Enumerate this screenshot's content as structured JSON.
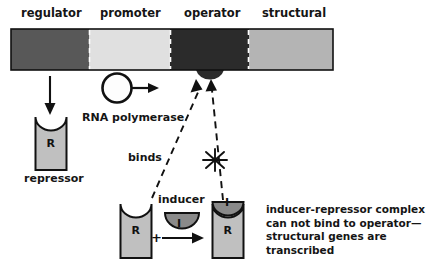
{
  "figure": {
    "colors": {
      "regulator": "#585858",
      "promoter": "#e0e0e0",
      "operator": "#2b2b2b",
      "structural": "#b4b4b4",
      "repressor_fill": "#c0c0c0",
      "inducer_fill": "#8a8a8a",
      "outline": "#111111",
      "text": "#151515",
      "background": "#ffffff"
    }
  },
  "gene_bar": {
    "segments": [
      {
        "id": "regulator",
        "label": "regulator",
        "color": "#585858"
      },
      {
        "id": "promoter",
        "label": "promoter",
        "color": "#e0e0e0"
      },
      {
        "id": "operator",
        "label": "operator",
        "color": "#2b2b2b"
      },
      {
        "id": "structural",
        "label": "structural",
        "color": "#b4b4b4"
      }
    ]
  },
  "labels": {
    "rna_polymerase": "RNA polymerase",
    "repressor": "repressor",
    "binds": "binds",
    "inducer": "inducer",
    "plus": "+",
    "repressor_symbol": "R",
    "inducer_symbol": "I"
  },
  "caption": {
    "text": "inducer-repressor complex can not bind to operator—structural genes are transcribed"
  },
  "icons": {
    "down_arrow": "down-arrow-icon",
    "right_arrow": "right-arrow-icon",
    "starburst_block": "starburst-block-icon",
    "dashed_binding_arrow": "dashed-binding-arrow-icon"
  }
}
